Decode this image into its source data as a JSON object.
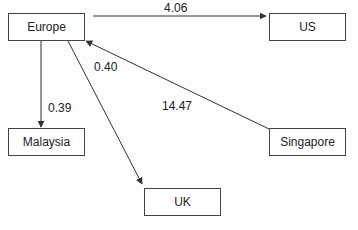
{
  "diagram": {
    "type": "directed-graph",
    "nodes": [
      {
        "id": "europe",
        "label": "Europe"
      },
      {
        "id": "us",
        "label": "US"
      },
      {
        "id": "malaysia",
        "label": "Malaysia"
      },
      {
        "id": "singapore",
        "label": "Singapore"
      },
      {
        "id": "uk",
        "label": "UK"
      }
    ],
    "edges": [
      {
        "from": "Europe",
        "to": "US",
        "label": "4.06"
      },
      {
        "from": "Europe",
        "to": "Malaysia",
        "label": "0.39"
      },
      {
        "from": "Europe",
        "to": "UK",
        "label": "0.40"
      },
      {
        "from": "Singapore",
        "to": "Europe",
        "label": "14.47"
      }
    ]
  }
}
